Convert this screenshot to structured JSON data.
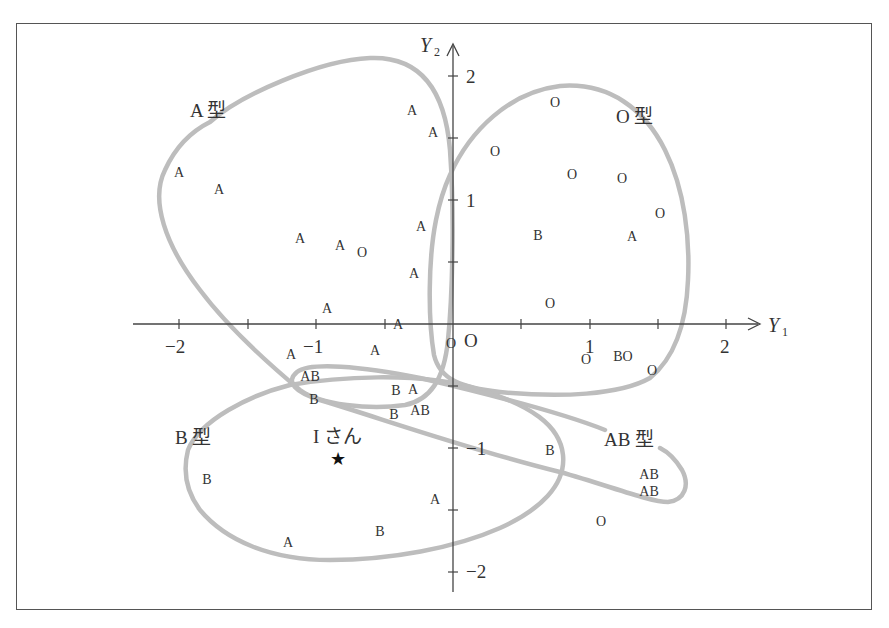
{
  "chart_data": {
    "type": "scatter",
    "title": "",
    "xlabel": "Y1",
    "ylabel": "Y2",
    "xlim": [
      -2.4,
      2.2
    ],
    "ylim": [
      -2.2,
      2.2
    ],
    "x_ticks": [
      -2,
      -1.5,
      -1,
      -0.5,
      0,
      0.5,
      1,
      1.5,
      2
    ],
    "x_tick_labels": [
      "−2",
      "−1",
      "1",
      "2"
    ],
    "y_ticks": [
      -2,
      -1.5,
      -1,
      -0.5,
      0,
      0.5,
      1,
      1.5,
      2
    ],
    "y_tick_labels": [
      "2",
      "1",
      "−1",
      "−2"
    ],
    "origin_label": "O",
    "grid": false,
    "series": [
      {
        "name": "A",
        "points": [
          [
            -0.3,
            1.73
          ],
          [
            -0.15,
            1.55
          ],
          [
            -1.99,
            1.23
          ],
          [
            -1.7,
            1.09
          ],
          [
            -1.12,
            0.69
          ],
          [
            -0.82,
            0.64
          ],
          [
            -0.23,
            0.79
          ],
          [
            -0.28,
            0.41
          ],
          [
            -0.92,
            0.13
          ],
          [
            -0.4,
            0.0
          ],
          [
            1.31,
            0.71
          ],
          [
            -1.18,
            -0.24
          ],
          [
            -0.57,
            -0.21
          ],
          [
            -0.29,
            -0.52
          ],
          [
            -0.13,
            -1.41
          ],
          [
            -1.2,
            -1.76
          ]
        ]
      },
      {
        "name": "O",
        "points": [
          [
            0.74,
            1.79
          ],
          [
            0.31,
            1.4
          ],
          [
            0.87,
            1.21
          ],
          [
            1.23,
            1.18
          ],
          [
            1.51,
            0.9
          ],
          [
            0.71,
            0.17
          ],
          [
            -0.66,
            0.58
          ],
          [
            -0.01,
            -0.15
          ],
          [
            0.97,
            -0.28
          ],
          [
            1.27,
            -0.26
          ],
          [
            1.45,
            -0.37
          ],
          [
            1.08,
            -1.59
          ]
        ]
      },
      {
        "name": "B",
        "points": [
          [
            0.62,
            0.72
          ],
          [
            1.21,
            -0.26
          ],
          [
            -1.01,
            -0.6
          ],
          [
            -0.42,
            -0.53
          ],
          [
            -0.43,
            -0.73
          ],
          [
            -1.8,
            -1.25
          ],
          [
            -0.53,
            -1.67
          ],
          [
            0.71,
            -1.02
          ]
        ]
      },
      {
        "name": "AB",
        "points": [
          [
            -1.04,
            -0.42
          ],
          [
            -0.24,
            -0.69
          ],
          [
            1.43,
            -1.21
          ],
          [
            1.43,
            -1.35
          ]
        ]
      }
    ],
    "annotations": [
      {
        "text": "Iさん",
        "marker": "star",
        "x": -0.82,
        "y": -1.08
      }
    ],
    "group_regions": [
      "A型",
      "O型",
      "B型",
      "AB型"
    ],
    "legend_position": "none"
  },
  "labels": {
    "axis_x": "Y",
    "axis_x_sub": "1",
    "axis_y": "Y",
    "axis_y_sub": "2",
    "origin": "O",
    "x_m2": "−2",
    "x_m1": "−1",
    "x_p1": "1",
    "x_p2": "2",
    "y_p2": "2",
    "y_p1": "1",
    "y_m1": "−1",
    "y_m2": "−2",
    "group_a": "A 型",
    "group_o": "O 型",
    "group_b": "B 型",
    "group_ab": "AB 型",
    "person": "I さん",
    "star": "★"
  },
  "points": [
    {
      "t": "A",
      "x": 412,
      "y": 110
    },
    {
      "t": "A",
      "x": 433,
      "y": 132
    },
    {
      "t": "A",
      "x": 179,
      "y": 172
    },
    {
      "t": "A",
      "x": 219,
      "y": 189
    },
    {
      "t": "A",
      "x": 300,
      "y": 238
    },
    {
      "t": "A",
      "x": 340,
      "y": 245
    },
    {
      "t": "O",
      "x": 362,
      "y": 252
    },
    {
      "t": "A",
      "x": 421,
      "y": 226
    },
    {
      "t": "A",
      "x": 414,
      "y": 273
    },
    {
      "t": "A",
      "x": 327,
      "y": 308
    },
    {
      "t": "A",
      "x": 398,
      "y": 324
    },
    {
      "t": "O",
      "x": 555,
      "y": 102
    },
    {
      "t": "O",
      "x": 495,
      "y": 151
    },
    {
      "t": "O",
      "x": 572,
      "y": 174
    },
    {
      "t": "O",
      "x": 622,
      "y": 178
    },
    {
      "t": "O",
      "x": 660,
      "y": 213
    },
    {
      "t": "B",
      "x": 538,
      "y": 235
    },
    {
      "t": "A",
      "x": 632,
      "y": 236
    },
    {
      "t": "O",
      "x": 550,
      "y": 303
    },
    {
      "t": "O",
      "x": 451,
      "y": 343
    },
    {
      "t": "O",
      "x": 586,
      "y": 359
    },
    {
      "t": "BO",
      "x": 623,
      "y": 356
    },
    {
      "t": "O",
      "x": 652,
      "y": 370
    },
    {
      "t": "A",
      "x": 291,
      "y": 354
    },
    {
      "t": "A",
      "x": 375,
      "y": 350
    },
    {
      "t": "AB",
      "x": 310,
      "y": 376
    },
    {
      "t": "B",
      "x": 314,
      "y": 399
    },
    {
      "t": "B",
      "x": 396,
      "y": 390
    },
    {
      "t": "A",
      "x": 413,
      "y": 389
    },
    {
      "t": "B",
      "x": 394,
      "y": 414
    },
    {
      "t": "AB",
      "x": 420,
      "y": 410
    },
    {
      "t": "B",
      "x": 207,
      "y": 479
    },
    {
      "t": "A",
      "x": 435,
      "y": 499
    },
    {
      "t": "B",
      "x": 380,
      "y": 531
    },
    {
      "t": "A",
      "x": 288,
      "y": 542
    },
    {
      "t": "B",
      "x": 550,
      "y": 450
    },
    {
      "t": "AB",
      "x": 649,
      "y": 474
    },
    {
      "t": "AB",
      "x": 649,
      "y": 491
    },
    {
      "t": "O",
      "x": 601,
      "y": 521
    }
  ],
  "colors": {
    "contour": "#bdbdbd",
    "axis": "#444444",
    "text": "#333333",
    "frame": "#555555"
  }
}
